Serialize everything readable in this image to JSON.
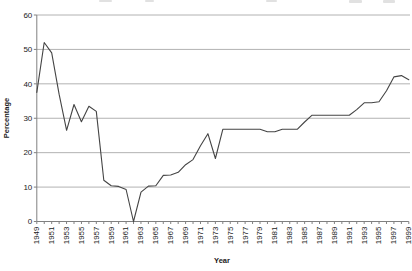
{
  "chart": {
    "colors": {
      "background": "#ffffff",
      "line": "#444444",
      "gridline": "#b2b2b2",
      "axis": "#808080",
      "text": "#1a1a1a"
    }
  },
  "chart_data": {
    "type": "line",
    "title": "",
    "xlabel": "Year",
    "ylabel": "Percentage",
    "ylim": [
      0,
      60
    ],
    "yticks": [
      0,
      10,
      20,
      30,
      40,
      50,
      60
    ],
    "grid": true,
    "legend": false,
    "xtick_labels": [
      "1949",
      "1951",
      "1953",
      "1955",
      "1957",
      "1959",
      "1961",
      "1963",
      "1965",
      "1967",
      "1969",
      "1971",
      "1973",
      "1975",
      "1977",
      "1979",
      "1981",
      "1983",
      "1985",
      "1987",
      "1989",
      "1991",
      "1993",
      "1995",
      "1997",
      "1999"
    ],
    "x": [
      1949,
      1950,
      1951,
      1952,
      1953,
      1954,
      1955,
      1956,
      1957,
      1958,
      1959,
      1960,
      1961,
      1962,
      1963,
      1964,
      1965,
      1966,
      1967,
      1968,
      1969,
      1970,
      1971,
      1972,
      1973,
      1974,
      1975,
      1976,
      1977,
      1978,
      1979,
      1980,
      1981,
      1982,
      1983,
      1984,
      1985,
      1986,
      1987,
      1988,
      1989,
      1990,
      1991,
      1992,
      1993,
      1994,
      1995,
      1996,
      1997,
      1998,
      1999
    ],
    "values": [
      37.5,
      52,
      49,
      37,
      26.5,
      34,
      29,
      33.5,
      32,
      12,
      10.4,
      10.2,
      9.3,
      0,
      8.5,
      10.3,
      10.4,
      13.4,
      13.5,
      14.3,
      16.5,
      18,
      22,
      25.5,
      18.3,
      26.8,
      26.8,
      26.8,
      26.8,
      26.8,
      26.8,
      26.1,
      26.1,
      26.8,
      26.8,
      26.8,
      28.9,
      30.9,
      30.9,
      30.9,
      30.9,
      30.9,
      30.9,
      32.5,
      34.5,
      34.5,
      34.8,
      38,
      42,
      42.4,
      41.2
    ]
  }
}
